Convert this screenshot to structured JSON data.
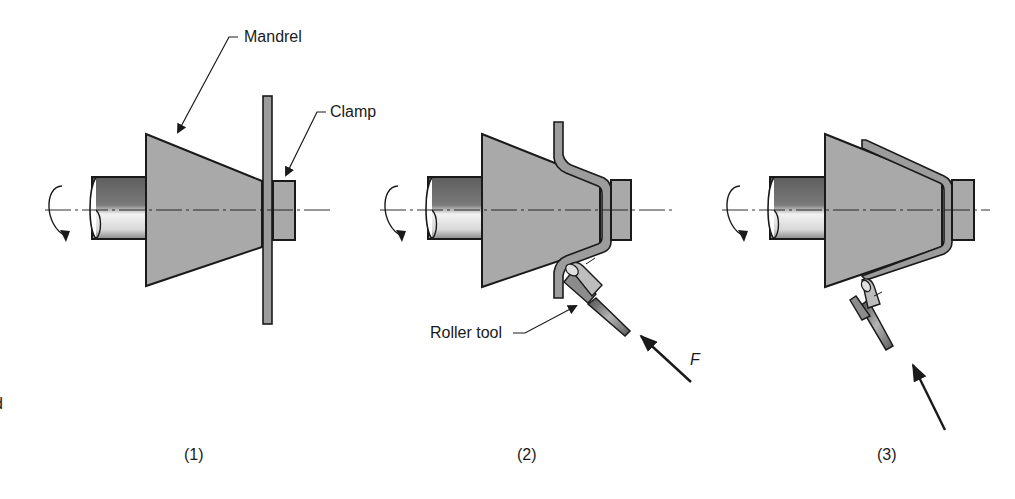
{
  "figure": {
    "type": "process-diagram",
    "colors": {
      "background": "#ffffff",
      "mandrel_fill": "#a9a9a9",
      "outline": "#1a1a1a",
      "sheet_fill": "#9c9c9c",
      "shaft_dark": "#6e6e6e",
      "shaft_light": "#e6e6e6"
    }
  },
  "labels": {
    "mandrel": "Mandrel",
    "clamp": "Clamp",
    "roller_tool": "Roller tool",
    "force": "F",
    "edge_fragment": "d"
  },
  "panels": [
    {
      "id": 1,
      "caption": "(1)",
      "stage": "flat blank clamped against mandrel"
    },
    {
      "id": 2,
      "caption": "(2)",
      "stage": "roller tool forces sheet onto mandrel"
    },
    {
      "id": 3,
      "caption": "(3)",
      "stage": "sheet fully formed to mandrel shape"
    }
  ]
}
